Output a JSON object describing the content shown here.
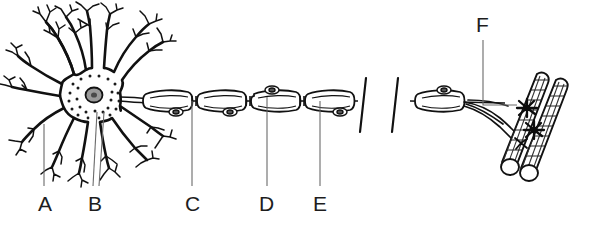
{
  "figure": {
    "background_color": "#ffffff",
    "ink_color": "#111111",
    "leader_color": "#6a6a6a",
    "label_color": "#1d1d1d"
  },
  "labels": [
    {
      "id": "A",
      "text": "A",
      "x": 38,
      "y": 193,
      "target": "dendrite"
    },
    {
      "id": "B",
      "text": "B",
      "x": 88,
      "y": 193,
      "target": "cell-body-soma"
    },
    {
      "id": "C",
      "text": "C",
      "x": 185,
      "y": 193,
      "target": "node-of-ranvier"
    },
    {
      "id": "D",
      "text": "D",
      "x": 259,
      "y": 193,
      "target": "myelin-sheath"
    },
    {
      "id": "E",
      "text": "E",
      "x": 313,
      "y": 193,
      "target": "schwann-cell"
    },
    {
      "id": "F",
      "text": "F",
      "x": 476,
      "y": 14,
      "target": "motor-end-plate"
    }
  ],
  "leaders": [
    {
      "id": "A",
      "points": "44,186 44,124"
    },
    {
      "id": "B1",
      "points": "93,186 97,112"
    },
    {
      "id": "B2",
      "points": "99,186 104,112"
    },
    {
      "id": "C",
      "points": "192,186 192,101"
    },
    {
      "id": "D",
      "points": "267,186 267,97"
    },
    {
      "id": "E",
      "points": "320,186 320,101"
    },
    {
      "id": "F",
      "points": "483,40 483,105 517,105"
    }
  ],
  "parts": {
    "dendrites_label": "dendrites",
    "soma_label": "cell body",
    "nucleus_label": "nucleus",
    "nissl_label": "nissl-bodies",
    "axon_label": "axon",
    "myelin_label": "myelin-sheath-segments",
    "node_label": "nodes-of-ranvier",
    "break_label": "axon-break-symbol",
    "terminal_label": "axon-terminal-branches",
    "muscle_label": "striated-muscle-fibers",
    "endplate_label": "motor-end-plates"
  }
}
